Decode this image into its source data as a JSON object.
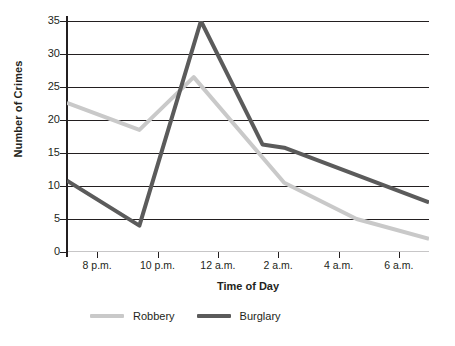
{
  "chart_data": {
    "type": "line",
    "title": "",
    "xlabel": "Time of Day",
    "ylabel": "Number of Crimes",
    "categories": [
      "8 p.m.",
      "10 p.m.",
      "12 a.m.",
      "2 a.m.",
      "4 a.m.",
      "6 a.m."
    ],
    "x_tick_labels": [
      "8 p.m.",
      "10 p.m.",
      "12 a.m.",
      "2 a.m.",
      "4 a.m.",
      "6 a.m."
    ],
    "y_tick_labels": [
      "35",
      "30",
      "25",
      "20",
      "15",
      "10",
      "5",
      "0"
    ],
    "ylim": [
      0,
      35
    ],
    "xlim": [
      20,
      30
    ],
    "y_ticks": [
      0,
      5,
      10,
      15,
      20,
      25,
      30,
      35
    ],
    "grid": "horizontal",
    "legend_position": "bottom",
    "series": [
      {
        "name": "Robbery",
        "color": "#c9c9c9",
        "points": [
          {
            "x": 20.0,
            "y": 22.6
          },
          {
            "x": 22.0,
            "y": 18.5
          },
          {
            "x": 23.5,
            "y": 26.5
          },
          {
            "x": 26.0,
            "y": 10.5
          },
          {
            "x": 28.0,
            "y": 5.0
          },
          {
            "x": 30.0,
            "y": 2.0
          }
        ],
        "values": [
          22.6,
          18.5,
          26.5,
          10.5,
          5.0,
          2.0
        ]
      },
      {
        "name": "Burglary",
        "color": "#5b5b5b",
        "points": [
          {
            "x": 20.0,
            "y": 10.8
          },
          {
            "x": 22.0,
            "y": 4.0
          },
          {
            "x": 23.7,
            "y": 35.0
          },
          {
            "x": 25.4,
            "y": 16.3
          },
          {
            "x": 26.0,
            "y": 15.8
          },
          {
            "x": 30.0,
            "y": 7.5
          }
        ],
        "values": [
          10.8,
          4.0,
          35.0,
          16.3,
          15.8,
          7.5
        ]
      }
    ]
  },
  "legend": {
    "items": [
      {
        "label": "Robbery",
        "color": "#c9c9c9"
      },
      {
        "label": "Burglary",
        "color": "#5b5b5b"
      }
    ]
  },
  "axis": {
    "y_title": "Number of Crimes",
    "x_title": "Time of Day"
  }
}
